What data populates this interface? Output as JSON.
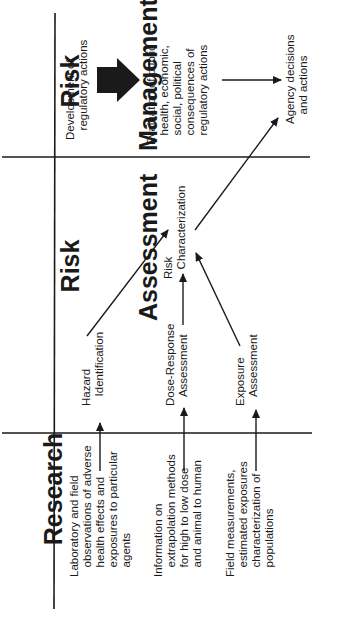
{
  "columns": [
    {
      "title_line1": "Research",
      "title_line2": ""
    },
    {
      "title_line1": "Risk",
      "title_line2": "Assessment"
    },
    {
      "title_line1": "Risk",
      "title_line2": "Management"
    }
  ],
  "research": {
    "item1": "Laboratory and field\n   observations of adverse\n   health effects and\n   exposures to particular\n   agents",
    "item2": "Information on\n   extrapolation methods\n   for high to low dose\n   and animal to human",
    "item3": "Field measurements,\n   estimated exposures\n   characterization of\n   populations"
  },
  "assessment": {
    "hazard": "Hazard\n   Identification",
    "dose_response": "Dose-Response\n   Assessment",
    "exposure": "Exposure\n   Assessment",
    "risk_char": "Risk\n   Characterization"
  },
  "management": {
    "development": "Development of\n   regulatory actions",
    "evaluation": "Evaluation of public\n   health, economic,\n   social, political\n   consequences of\n   regulatory actions",
    "agency": "Agency decisions\n   and actions"
  },
  "colors": {
    "ink": "#1a1a1a",
    "background": "#ffffff"
  }
}
